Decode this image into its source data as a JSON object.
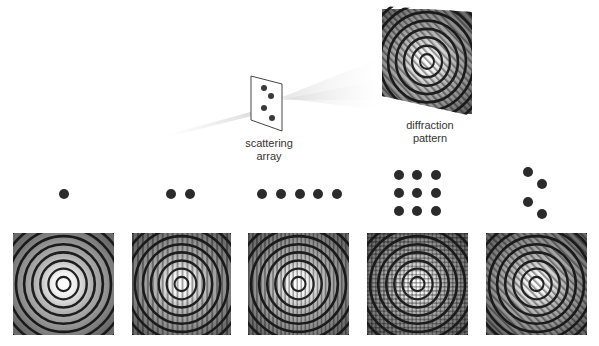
{
  "top": {
    "scattering_array_label": [
      "scattering",
      "array"
    ],
    "diffraction_pattern_label": [
      "diffraction",
      "pattern"
    ]
  },
  "examples": [
    {
      "id": "single",
      "dots": 1,
      "arrangement": "single point",
      "pattern_texture": "none"
    },
    {
      "id": "pair",
      "dots": 2,
      "arrangement": "horizontal pair",
      "pattern_texture": "vertical fringes (wide)"
    },
    {
      "id": "row5",
      "dots": 5,
      "arrangement": "horizontal row of five",
      "pattern_texture": "vertical fringes (fine)"
    },
    {
      "id": "grid3x3",
      "dots": 9,
      "arrangement": "3x3 square grid",
      "pattern_texture": "crosshatch grid"
    },
    {
      "id": "zigzag4",
      "dots": 4,
      "arrangement": "zigzag of four",
      "pattern_texture": "diagonal hatching"
    }
  ],
  "colors": {
    "dot": "#2b2b2b",
    "ring_dark": "#1e1e1e",
    "pattern_bg": "#7a7a7a",
    "center_bright": "#ffffff",
    "label_text": "#333333"
  }
}
